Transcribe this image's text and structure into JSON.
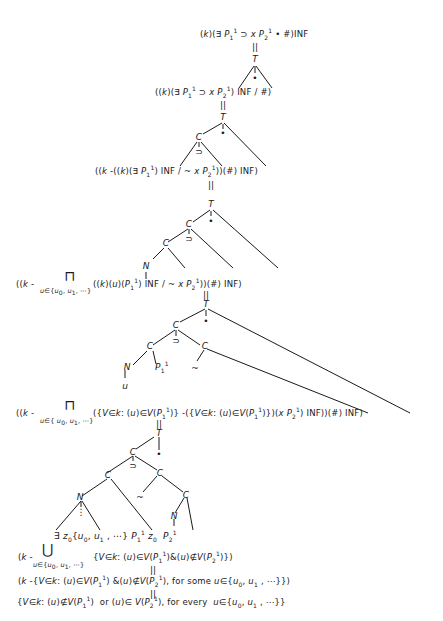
{
  "diagram": {
    "formulas": [
      {
        "id": "f1",
        "text": "(k)(∃ P₁¹ ⊃ x P₂¹ • #)INF"
      },
      {
        "id": "f2",
        "text": "((k)(∃ P₁¹ ⊃ x P₂¹) INF / #)"
      },
      {
        "id": "f3",
        "text": "((k-((k)(∃ P₁¹) INF / ~ x P₂¹))(#) INF)"
      },
      {
        "id": "f4",
        "prefix": "((k -",
        "operator": "⊓",
        "subscript": "u∈{u₀, u₁, ⋯}",
        "text": "((k)(u)(P₁¹) INF / ~ x P₂¹))(#) INF)"
      },
      {
        "id": "f5",
        "prefix": "((k -",
        "operator": "⊓",
        "subscript": "u∈{u₀, u₁, ⋯}",
        "text": "({V∈k:(u)∈V(P₁¹)} -({V∈k:(u)∈V(P₁¹)})(x P₂¹) INF))(#) INF)"
      },
      {
        "id": "f6",
        "text": "∃ z₀{u₀, u₁, ⋯} P₁¹ z₀ P₂¹"
      },
      {
        "id": "f7",
        "prefix": "(k -",
        "operator": "⋃",
        "subscript": "u∈{u₀, u₁, ⋯}",
        "text": "{V∈k:(u)∈V(P₁¹)&(u)∉V(P₂¹)})"
      },
      {
        "id": "f8",
        "text": "(k -{V∈k:(u)∈V(P₁¹)&(u)∉V(P₂¹), for some u∈{u₀, u₁, ⋯}})"
      },
      {
        "id": "f9",
        "text": "{V∈k:(u)∉V(P₁¹) or (u)∈V(P₂¹), for every u∈{u₀, u₁, ⋯}}"
      }
    ],
    "node_labels": {
      "T": "T",
      "C": "C",
      "N": "N",
      "dot": "•",
      "horseshoe": "⊃",
      "tilde": "~",
      "equals": "||",
      "u": "u",
      "vdots": "⋮",
      "P11": "P",
      "z0": "z"
    }
  }
}
